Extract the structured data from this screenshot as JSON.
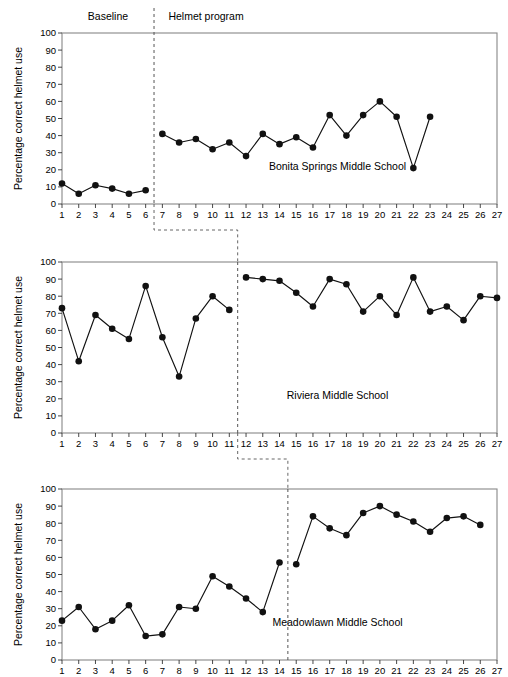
{
  "figure": {
    "xlabel": "Daily sessions",
    "ylabel": "Percentage correct helmet use",
    "phase_labels": {
      "baseline": "Baseline",
      "intervention": "Helmet program"
    }
  },
  "chart_data": {
    "type": "line",
    "title": "",
    "subtitle": "",
    "xlabel": "Daily sessions",
    "ylabel": "Percentage correct helmet use",
    "xlim": [
      1,
      27
    ],
    "ylim": [
      0,
      100
    ],
    "grid": false,
    "legend": "none",
    "x_ticks": [
      1,
      2,
      3,
      4,
      5,
      6,
      7,
      8,
      9,
      10,
      11,
      12,
      13,
      14,
      15,
      16,
      17,
      18,
      19,
      20,
      21,
      22,
      23,
      24,
      25,
      26,
      27
    ],
    "y_ticks": [
      0,
      10,
      20,
      30,
      40,
      50,
      60,
      70,
      80,
      90,
      100
    ],
    "design": "multiple-baseline across settings",
    "phases": [
      "Baseline",
      "Helmet program"
    ],
    "panels": [
      {
        "name": "Bonita Springs Middle School",
        "label": "Bonita Springs Middle School",
        "phase_change_after_session": 6,
        "baseline": {
          "name": "Baseline",
          "x": [
            1,
            2,
            3,
            4,
            5,
            6
          ],
          "values": [
            12,
            6,
            11,
            9,
            6,
            8
          ]
        },
        "intervention": {
          "name": "Helmet program",
          "x": [
            7,
            8,
            9,
            10,
            11,
            12,
            13,
            14,
            15,
            16,
            17,
            18,
            19,
            20,
            21,
            22,
            23
          ],
          "values": [
            41,
            36,
            38,
            32,
            36,
            28,
            41,
            35,
            39,
            33,
            52,
            40,
            52,
            60,
            51,
            21,
            51
          ]
        }
      },
      {
        "name": "Riviera Middle School",
        "label": "Riviera Middle School",
        "phase_change_after_session": 11,
        "baseline": {
          "name": "Baseline",
          "x": [
            1,
            2,
            3,
            4,
            5,
            6,
            7,
            8,
            9,
            10,
            11
          ],
          "values": [
            73,
            42,
            69,
            61,
            55,
            86,
            56,
            33,
            67,
            80,
            72
          ]
        },
        "intervention": {
          "name": "Helmet program",
          "x": [
            12,
            13,
            14,
            15,
            16,
            17,
            18,
            19,
            20,
            21,
            22,
            23,
            24,
            25,
            26,
            27
          ],
          "values": [
            91,
            90,
            89,
            82,
            74,
            90,
            87,
            71,
            80,
            69,
            91,
            71,
            74,
            66,
            80,
            79
          ]
        }
      },
      {
        "name": "Meadowlawn Middle School",
        "label": "Meadowlawn Middle School",
        "phase_change_after_session": 14,
        "baseline": {
          "name": "Baseline",
          "x": [
            1,
            2,
            3,
            4,
            5,
            6,
            7,
            8,
            9,
            10,
            11,
            12,
            13,
            14
          ],
          "values": [
            23,
            31,
            18,
            23,
            32,
            14,
            15,
            31,
            30,
            49,
            43,
            36,
            28,
            57
          ]
        },
        "intervention": {
          "name": "Helmet program",
          "x": [
            15,
            16,
            17,
            18,
            19,
            20,
            21,
            22,
            23,
            24,
            25,
            26
          ],
          "values": [
            56,
            84,
            77,
            73,
            86,
            90,
            85,
            81,
            75,
            83,
            84,
            79
          ]
        }
      }
    ]
  },
  "colors": {
    "line": "#111111",
    "marker": "#111111",
    "frame": "#888888",
    "phase_line": "#555555",
    "background": "#ffffff"
  }
}
